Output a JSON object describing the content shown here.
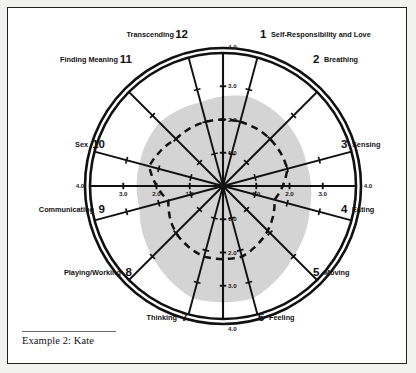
{
  "caption": {
    "text": "Example 2: Kate"
  },
  "chart_data": {
    "type": "radar",
    "title": "Example 2: Kate",
    "xlabel": "",
    "ylabel": "",
    "rmax": 4.0,
    "grid": false,
    "legend_position": "none",
    "radial_tick_labels": [
      "1.0",
      "2.0",
      "3.0",
      "4.0"
    ],
    "radial_ticks": [
      1.0,
      2.0,
      3.0,
      4.0
    ],
    "axis_end_label": "4.0",
    "spoke_count": 12,
    "categories": [
      "Self-Responsibility and Love",
      "Breathing",
      "Sensing",
      "Eating",
      "Moving",
      "Feeling",
      "Thinking",
      "Playing/Working",
      "Communicating",
      "Sex",
      "Finding Meaning",
      "Transcending"
    ],
    "category_numbers": [
      "1",
      "2",
      "3",
      "4",
      "5",
      "6",
      "7",
      "8",
      "9",
      "10",
      "11",
      "12"
    ],
    "series": [
      {
        "name": "Kate",
        "style": "dashed",
        "values": [
          2.0,
          2.0,
          2.0,
          1.6,
          1.9,
          2.2,
          2.2,
          2.0,
          1.7,
          2.3,
          2.0,
          2.0
        ]
      },
      {
        "name": "Reference region",
        "style": "filled",
        "values": [
          2.8,
          2.7,
          2.6,
          2.7,
          3.0,
          3.5,
          3.5,
          3.0,
          2.6,
          2.6,
          2.7,
          2.6
        ]
      }
    ]
  },
  "labels": [
    {
      "num": "1",
      "name": "Self-Responsibility and Love",
      "num_x": 252,
      "num_y": 30,
      "name_x": 263,
      "name_y": 29,
      "anchor": "start"
    },
    {
      "num": "2",
      "name": "Breathing",
      "num_x": 305,
      "num_y": 55,
      "name_x": 316,
      "name_y": 54,
      "anchor": "start"
    },
    {
      "num": "3",
      "name": "Sensing",
      "num_x": 333,
      "num_y": 140,
      "name_x": 344,
      "name_y": 139,
      "anchor": "start"
    },
    {
      "num": "4",
      "name": "Eating",
      "num_x": 333,
      "num_y": 205,
      "name_x": 344,
      "name_y": 204,
      "anchor": "start"
    },
    {
      "num": "5",
      "name": "Moving",
      "num_x": 305,
      "num_y": 268,
      "name_x": 316,
      "name_y": 267,
      "anchor": "start"
    },
    {
      "num": "6",
      "name": "Feeling",
      "num_x": 250,
      "num_y": 313,
      "name_x": 261,
      "name_y": 312,
      "anchor": "start"
    },
    {
      "num": "7",
      "name": "Thinking",
      "num_x": 180,
      "num_y": 313,
      "name_x": 169,
      "name_y": 312,
      "anchor": "end"
    },
    {
      "num": "8",
      "name": "Playing/Working",
      "num_x": 124,
      "num_y": 268,
      "name_x": 113,
      "name_y": 267,
      "anchor": "end"
    },
    {
      "num": "9",
      "name": "Communicating",
      "num_x": 97,
      "num_y": 205,
      "name_x": 86,
      "name_y": 204,
      "anchor": "end"
    },
    {
      "num": "10",
      "name": "Sex",
      "num_x": 97,
      "num_y": 140,
      "name_x": 80,
      "name_y": 139,
      "anchor": "end"
    },
    {
      "num": "11",
      "name": "Finding Meaning",
      "num_x": 124,
      "num_y": 55,
      "name_x": 110,
      "name_y": 54,
      "anchor": "end"
    },
    {
      "num": "12",
      "name": "Transcending",
      "num_x": 180,
      "num_y": 30,
      "name_x": 166,
      "name_y": 29,
      "anchor": "end"
    }
  ],
  "tick_labels": {
    "top_outer": "4.0",
    "bottom_outer": "4.0",
    "left_outer": "4.0",
    "right_outer": "4.0",
    "vertical_up": [
      "1.0",
      "2.0",
      "3.0"
    ],
    "vertical_down": [
      "1.0",
      "2.0",
      "3.0"
    ],
    "horizontal_left": [
      "1.0",
      "2.0",
      "3.0"
    ],
    "horizontal_right": [
      "1.0",
      "2.0",
      "3.0"
    ]
  },
  "colors": {
    "ink": "#111111",
    "region_fill": "#d4d4d4",
    "page_bg": "#f2f2f0",
    "frame_bg": "#ffffff"
  }
}
